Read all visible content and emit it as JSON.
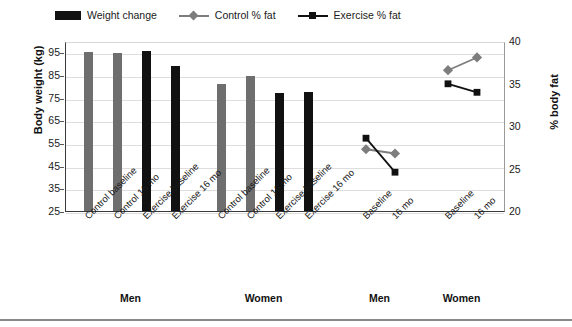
{
  "chart_data": {
    "type": "bar",
    "title": "",
    "subtitle": "",
    "xlabel": "",
    "ylabel": "Body weight (kg)",
    "ylabel_secondary": "% body fat",
    "ylim": [
      25,
      100
    ],
    "yticks": [
      25,
      35,
      45,
      55,
      65,
      75,
      85,
      95
    ],
    "ylim_secondary": [
      20,
      40
    ],
    "yticks_secondary": [
      20,
      25,
      30,
      35,
      40
    ],
    "grid": true,
    "legend_position": "top-left",
    "categories": [
      "Control baseline",
      "Control 16 mo",
      "Exercise baseline",
      "Exercise 16 mo",
      "Control baseline",
      "Control 16 mo",
      "Exercise baseline",
      "Exercise 16 mo",
      "Baseline",
      "16 mo",
      "Baseline",
      "16 mo"
    ],
    "group_labels": [
      "Men",
      "Women",
      "Men",
      "Women"
    ],
    "series": [
      {
        "name": "Weight change",
        "type": "bar",
        "axis": "left",
        "unit": "kg",
        "points": [
          {
            "category": "Control baseline",
            "group": "Men",
            "value": 95.0,
            "color": "#6e6e6e",
            "arm": "Control"
          },
          {
            "category": "Control 16 mo",
            "group": "Men",
            "value": 94.9,
            "color": "#6e6e6e",
            "arm": "Control"
          },
          {
            "category": "Exercise baseline",
            "group": "Men",
            "value": 95.4,
            "color": "#111111",
            "arm": "Exercise"
          },
          {
            "category": "Exercise 16 mo",
            "group": "Men",
            "value": 89.0,
            "color": "#111111",
            "arm": "Exercise"
          },
          {
            "category": "Control baseline",
            "group": "Women",
            "value": 81.0,
            "color": "#6e6e6e",
            "arm": "Control"
          },
          {
            "category": "Control 16 mo",
            "group": "Women",
            "value": 84.4,
            "color": "#6e6e6e",
            "arm": "Control"
          },
          {
            "category": "Exercise baseline",
            "group": "Women",
            "value": 77.0,
            "color": "#111111",
            "arm": "Exercise"
          },
          {
            "category": "Exercise 16 mo",
            "group": "Women",
            "value": 77.5,
            "color": "#111111",
            "arm": "Exercise"
          }
        ]
      },
      {
        "name": "Control % fat",
        "type": "line",
        "axis": "right",
        "unit": "%",
        "marker": "diamond",
        "color": "#7d7d7d",
        "points": [
          {
            "category": "Baseline",
            "group": "Men",
            "value": 27.5
          },
          {
            "category": "16 mo",
            "group": "Men",
            "value": 27.0
          },
          {
            "category": "Baseline",
            "group": "Women",
            "value": 36.8
          },
          {
            "category": "16 mo",
            "group": "Women",
            "value": 38.3
          }
        ]
      },
      {
        "name": "Exercise % fat",
        "type": "line",
        "axis": "right",
        "unit": "%",
        "marker": "square",
        "color": "#111111",
        "points": [
          {
            "category": "Baseline",
            "group": "Men",
            "value": 28.8
          },
          {
            "category": "16 mo",
            "group": "Men",
            "value": 24.8
          },
          {
            "category": "Baseline",
            "group": "Women",
            "value": 35.2
          },
          {
            "category": "16 mo",
            "group": "Women",
            "value": 34.2
          }
        ]
      }
    ]
  },
  "legend": {
    "items": [
      {
        "label": "Weight change",
        "marker": "bar-swatch",
        "color": "#111111"
      },
      {
        "label": "Control % fat",
        "marker": "line-diamond",
        "color": "#7d7d7d"
      },
      {
        "label": "Exercise % fat",
        "marker": "line-square",
        "color": "#111111"
      }
    ]
  },
  "axes": {
    "left": {
      "title": "Body weight (kg)",
      "ticks": [
        "95",
        "85",
        "75",
        "65",
        "55",
        "45",
        "35",
        "25"
      ]
    },
    "right": {
      "title": "% body fat",
      "ticks": [
        "40",
        "35",
        "30",
        "25",
        "20"
      ]
    }
  },
  "x_axis": {
    "category_labels": [
      "Control baseline",
      "Control 16 mo",
      "Exercise baseline",
      "Exercise 16 mo",
      "Control baseline",
      "Control 16 mo",
      "Exercise baseline",
      "Exercise 16 mo",
      "Baseline",
      "16 mo",
      "Baseline",
      "16 mo"
    ],
    "group_labels": [
      "Men",
      "Women",
      "Men",
      "Women"
    ]
  }
}
